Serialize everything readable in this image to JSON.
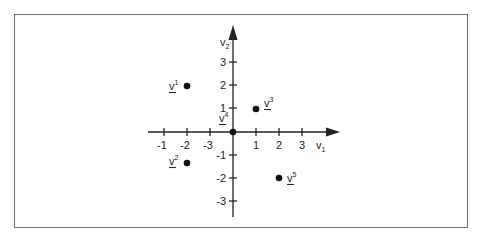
{
  "diagram": {
    "type": "scatter-plot",
    "axes": {
      "x": {
        "label": "v",
        "label_subscript": "1",
        "tick_labels": [
          "-1",
          "-2",
          "-3",
          "1",
          "2",
          "3"
        ],
        "tick_positions": [
          -4,
          -3,
          -2,
          1,
          2,
          3
        ]
      },
      "y": {
        "label": "v",
        "label_subscript": "2",
        "tick_labels": [
          "3",
          "2",
          "1",
          "-1",
          "-2",
          "-3"
        ],
        "tick_values": [
          3,
          2,
          1,
          -1,
          -2,
          -3
        ]
      }
    },
    "points": [
      {
        "name": "v",
        "superscript": "1",
        "x": -2,
        "y": 2
      },
      {
        "name": "v",
        "superscript": "2",
        "x": -2,
        "y": -1.35
      },
      {
        "name": "v",
        "superscript": "3",
        "x": 1,
        "y": 1
      },
      {
        "name": "v",
        "superscript": "4",
        "x": 0,
        "y": 0
      },
      {
        "name": "v",
        "superscript": "5",
        "x": 2,
        "y": -2
      }
    ],
    "colors": {
      "axis": "#222222",
      "point": "#111111",
      "frame": "#6e6e6e"
    }
  }
}
